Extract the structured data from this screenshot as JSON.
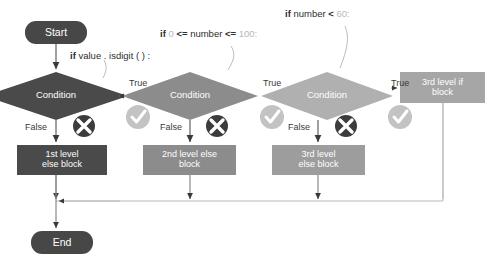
{
  "diagram": {
    "colors": {
      "terminator_fill": "#474747",
      "diamond_1_fill": "#4a4a4a",
      "diamond_2_fill": "#8c8c8c",
      "diamond_3_fill": "#b0b0b0",
      "block_1_fill": "#4a4a4a",
      "block_2_fill": "#8c8c8c",
      "block_3_fill": "#9d9d9d",
      "if_block_fill": "#a6a6a6",
      "connector_line": "#5a5a5a",
      "merge_line": "#b9b9b9",
      "cross_icon_fill": "#3c3c3c",
      "check_icon_fill": "#c3c3c3",
      "code_text": "#2e2e2e",
      "code_number": "#b7b7b7",
      "edge_label_text": "#3b3b3b"
    },
    "terminators": [
      {
        "id": "start",
        "label": "Start"
      },
      {
        "id": "end",
        "label": "End"
      }
    ],
    "decisions": [
      {
        "id": "condition-1",
        "label": "Condition"
      },
      {
        "id": "condition-2",
        "label": "Condition"
      },
      {
        "id": "condition-3",
        "label": "Condition"
      }
    ],
    "process_blocks": [
      {
        "id": "else-block-1",
        "label": "1st level\nelse block"
      },
      {
        "id": "else-block-2",
        "label": "2nd level else\nblock"
      },
      {
        "id": "else-block-3",
        "label": "3rd level\nelse block"
      },
      {
        "id": "if-block-3",
        "label": "3rd level if\nblock"
      }
    ],
    "edge_labels": {
      "true_1": "True",
      "true_2": "True",
      "true_3": "True",
      "false_1": "False",
      "false_2": "False",
      "false_3": "False"
    },
    "code_annotations": [
      {
        "id": "code-1",
        "text": "if value . isdigit ( ) :",
        "tokens": [
          {
            "t": "if",
            "kind": "keyword"
          },
          {
            "t": "value . isdigit ( ) :",
            "kind": "plain"
          }
        ]
      },
      {
        "id": "code-2",
        "text": "if 0 <= number <= 100:",
        "tokens": [
          {
            "t": "if",
            "kind": "keyword"
          },
          {
            "t": "0",
            "kind": "number"
          },
          {
            "t": "<=",
            "kind": "operator"
          },
          {
            "t": "number",
            "kind": "plain"
          },
          {
            "t": "<=",
            "kind": "operator"
          },
          {
            "t": "100:",
            "kind": "number"
          }
        ]
      },
      {
        "id": "code-3",
        "text": "if number < 60:",
        "tokens": [
          {
            "t": "if",
            "kind": "keyword"
          },
          {
            "t": "number",
            "kind": "plain"
          },
          {
            "t": "<",
            "kind": "operator"
          },
          {
            "t": "60:",
            "kind": "number"
          }
        ]
      }
    ],
    "status_icons": [
      {
        "id": "cross-1",
        "name": "cross-icon"
      },
      {
        "id": "check-1",
        "name": "check-icon"
      },
      {
        "id": "cross-2",
        "name": "cross-icon"
      },
      {
        "id": "check-2",
        "name": "check-icon"
      },
      {
        "id": "cross-3",
        "name": "cross-icon"
      },
      {
        "id": "check-3",
        "name": "check-icon"
      }
    ]
  }
}
